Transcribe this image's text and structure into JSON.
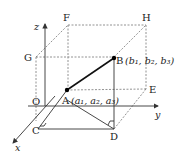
{
  "diagram": {
    "type": "3d-coordinate-box",
    "axes": {
      "x": {
        "label": "x"
      },
      "y": {
        "label": "y"
      },
      "z": {
        "label": "z"
      },
      "origin": {
        "label": "O"
      }
    },
    "points": {
      "A": {
        "label": "A",
        "coords": "(a₁, a₂, a₃)"
      },
      "B": {
        "label": "B",
        "coords": "(b₁, b₂, b₃)"
      },
      "C": {
        "label": "C"
      },
      "D": {
        "label": "D"
      },
      "E": {
        "label": "E"
      },
      "F": {
        "label": "F"
      },
      "G": {
        "label": "G"
      },
      "H": {
        "label": "H"
      }
    },
    "segment": {
      "from": "A",
      "to": "B"
    },
    "colors": {
      "line": "#333333",
      "dashed": "#777777",
      "point": "#000000"
    }
  }
}
